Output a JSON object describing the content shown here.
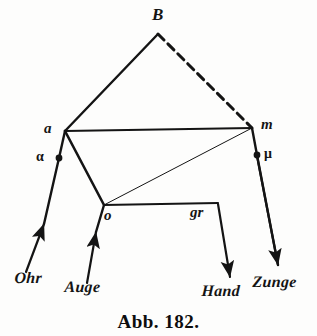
{
  "figure": {
    "caption": "Abb. 182.",
    "ink_color": "#141414",
    "background_color": "#fdfdfc",
    "width": 317,
    "height": 336
  },
  "points": {
    "B": {
      "label": "B",
      "x": 158,
      "y": 34
    },
    "a": {
      "label": "a",
      "x": 65,
      "y": 131
    },
    "m": {
      "label": "m",
      "x": 252,
      "y": 128
    },
    "alpha": {
      "label": "α",
      "x": 59,
      "y": 158
    },
    "mu": {
      "label": "μ",
      "x": 257,
      "y": 155
    },
    "o": {
      "label": "o",
      "x": 104,
      "y": 205
    },
    "gr": {
      "label": "gr",
      "x": 218,
      "y": 203
    }
  },
  "point_labels": [
    {
      "name": "label-B",
      "text": "B",
      "left": 152,
      "top": 6,
      "style": "pt-label big"
    },
    {
      "name": "label-a",
      "text": "a",
      "left": 44,
      "top": 121,
      "style": "pt-label"
    },
    {
      "name": "label-m",
      "text": "m",
      "left": 261,
      "top": 117,
      "style": "pt-label"
    },
    {
      "name": "label-alpha",
      "text": "α",
      "left": 36,
      "top": 150,
      "style": "greek-label"
    },
    {
      "name": "label-mu",
      "text": "μ",
      "left": 264,
      "top": 147,
      "style": "greek-label"
    },
    {
      "name": "label-o",
      "text": "o",
      "left": 104,
      "top": 208,
      "style": "pt-label"
    },
    {
      "name": "label-gr",
      "text": "gr",
      "left": 190,
      "top": 205,
      "style": "pt-label"
    }
  ],
  "organ_labels": [
    {
      "name": "label-ohr",
      "text": "Ohr",
      "left": 14,
      "top": 270
    },
    {
      "name": "label-auge",
      "text": "Auge",
      "left": 64,
      "top": 279
    },
    {
      "name": "label-hand",
      "text": "Hand",
      "left": 201,
      "top": 283
    },
    {
      "name": "label-zunge",
      "text": "Zunge",
      "left": 252,
      "top": 274
    }
  ],
  "edges": [
    {
      "name": "edge-a-B",
      "from": "a",
      "to": "B",
      "style": "solid",
      "width": 2.4
    },
    {
      "name": "edge-B-m",
      "from": "B",
      "to": "m",
      "style": "dashed",
      "width": 3.0
    },
    {
      "name": "edge-a-m",
      "from": "a",
      "to": "m",
      "style": "solid",
      "width": 2.0
    },
    {
      "name": "edge-a-o",
      "from": "a",
      "to": "o",
      "style": "solid",
      "width": 2.6
    },
    {
      "name": "edge-o-m",
      "from": "o",
      "to": "m",
      "style": "solid",
      "width": 1.0
    },
    {
      "name": "edge-o-gr",
      "from": "o",
      "to": "gr",
      "style": "solid",
      "width": 2.2
    }
  ],
  "arrows": [
    {
      "name": "arrow-ohr",
      "organ": "Ohr",
      "tail_x": 26,
      "tail_y": 272,
      "head_x": 44,
      "head_y": 224
    },
    {
      "name": "arrow-auge",
      "organ": "Auge",
      "tail_x": 87,
      "tail_y": 283,
      "head_x": 96,
      "head_y": 232
    },
    {
      "name": "arrow-hand",
      "organ": "Hand",
      "tail_x": 218,
      "tail_y": 204,
      "head_x": 230,
      "head_y": 277
    },
    {
      "name": "arrow-zunge",
      "organ": "Zunge",
      "tail_x": 257,
      "tail_y": 156,
      "head_x": 278,
      "head_y": 265
    }
  ],
  "connector_segments": [
    {
      "name": "seg-alpha-to-a",
      "x1": 59,
      "y1": 158,
      "x2": 65,
      "y2": 131,
      "width": 2.4
    },
    {
      "name": "seg-alpha-down",
      "x1": 59,
      "y1": 158,
      "x2": 44,
      "y2": 224,
      "width": 2.4
    },
    {
      "name": "seg-mu-to-m",
      "x1": 257,
      "y1": 155,
      "x2": 252,
      "y2": 128,
      "width": 2.4
    },
    {
      "name": "seg-mu-down",
      "x1": 257,
      "y1": 155,
      "x2": 278,
      "y2": 265,
      "width": 2.4
    },
    {
      "name": "seg-auge-to-o",
      "x1": 96,
      "y1": 232,
      "x2": 104,
      "y2": 205,
      "width": 2.4
    }
  ],
  "dots": [
    {
      "name": "dot-alpha",
      "x": 59,
      "y": 158,
      "r": 3.4
    },
    {
      "name": "dot-mu",
      "x": 257,
      "y": 155,
      "r": 3.4
    }
  ],
  "chart_data": {
    "type": "diagram",
    "title": "Abb. 182.",
    "nodes": [
      {
        "id": "B",
        "label": "B",
        "x": 158,
        "y": 34
      },
      {
        "id": "a",
        "label": "a",
        "x": 65,
        "y": 131
      },
      {
        "id": "m",
        "label": "m",
        "x": 252,
        "y": 128
      },
      {
        "id": "alpha",
        "label": "α",
        "x": 59,
        "y": 158
      },
      {
        "id": "mu",
        "label": "μ",
        "x": 257,
        "y": 155
      },
      {
        "id": "o",
        "label": "o",
        "x": 104,
        "y": 205
      },
      {
        "id": "gr",
        "label": "gr",
        "x": 218,
        "y": 203
      }
    ],
    "links": [
      {
        "source": "a",
        "target": "B",
        "style": "solid"
      },
      {
        "source": "B",
        "target": "m",
        "style": "dashed"
      },
      {
        "source": "a",
        "target": "m",
        "style": "solid"
      },
      {
        "source": "a",
        "target": "o",
        "style": "solid"
      },
      {
        "source": "o",
        "target": "m",
        "style": "thin"
      },
      {
        "source": "o",
        "target": "gr",
        "style": "solid"
      }
    ],
    "inputs": [
      "Ohr",
      "Auge"
    ],
    "outputs": [
      "Hand",
      "Zunge"
    ]
  }
}
